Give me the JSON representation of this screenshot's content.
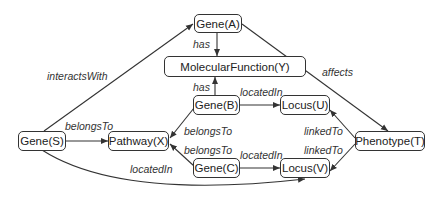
{
  "diagram": {
    "nodes": [
      {
        "id": "geneA",
        "label": "Gene(A)"
      },
      {
        "id": "molfunY",
        "label": "MolecularFunction(Y)"
      },
      {
        "id": "geneB",
        "label": "Gene(B)"
      },
      {
        "id": "locusU",
        "label": "Locus(U)"
      },
      {
        "id": "geneS",
        "label": "Gene(S)"
      },
      {
        "id": "pathwayX",
        "label": "Pathway(X)"
      },
      {
        "id": "phenotypeT",
        "label": "Phenotype(T)"
      },
      {
        "id": "geneC",
        "label": "Gene(C)"
      },
      {
        "id": "locusV",
        "label": "Locus(V)"
      }
    ],
    "edges": [
      {
        "from": "geneS",
        "to": "geneA",
        "label": "interactsWith"
      },
      {
        "from": "geneA",
        "to": "molfunY",
        "label": "has"
      },
      {
        "from": "geneA",
        "to": "phenotypeT",
        "label": "affects"
      },
      {
        "from": "geneB",
        "to": "molfunY",
        "label": "has"
      },
      {
        "from": "geneB",
        "to": "locusU",
        "label": "locatedIn"
      },
      {
        "from": "geneS",
        "to": "pathwayX",
        "label": "belongsTo"
      },
      {
        "from": "geneB",
        "to": "pathwayX",
        "label": "belongsTo"
      },
      {
        "from": "geneC",
        "to": "pathwayX",
        "label": "belongsTo"
      },
      {
        "from": "geneC",
        "to": "locusV",
        "label": "locatedIn"
      },
      {
        "from": "geneS",
        "to": "locusV",
        "label": "locatedIn"
      },
      {
        "from": "phenotypeT",
        "to": "locusU",
        "label": "linkedTo"
      },
      {
        "from": "phenotypeT",
        "to": "locusV",
        "label": "linkedTo"
      }
    ]
  }
}
